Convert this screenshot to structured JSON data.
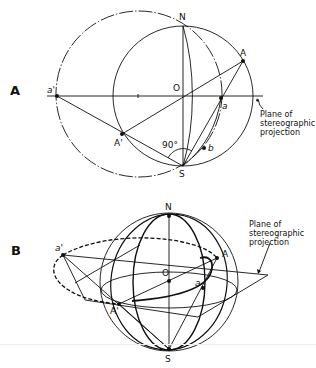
{
  "figure": {
    "panels": [
      {
        "id": "A",
        "label": "A",
        "points": {
          "N": "N",
          "O": "O",
          "S": "S",
          "A": "A",
          "a": "a",
          "A_prime": "A'",
          "a_prime": "a'",
          "b": "b"
        },
        "angle_label": "90°",
        "annotation": "Plane of\nstereographic\nprojection"
      },
      {
        "id": "B",
        "label": "B",
        "points": {
          "N": "N",
          "O": "O",
          "S": "S",
          "A": "A",
          "a": "a",
          "A_prime": "A'",
          "a_prime": "a'"
        },
        "annotation": "Plane of\nstereographic\nprojection"
      }
    ],
    "colors": {
      "ink": "#111111",
      "background": "#ffffff"
    }
  }
}
